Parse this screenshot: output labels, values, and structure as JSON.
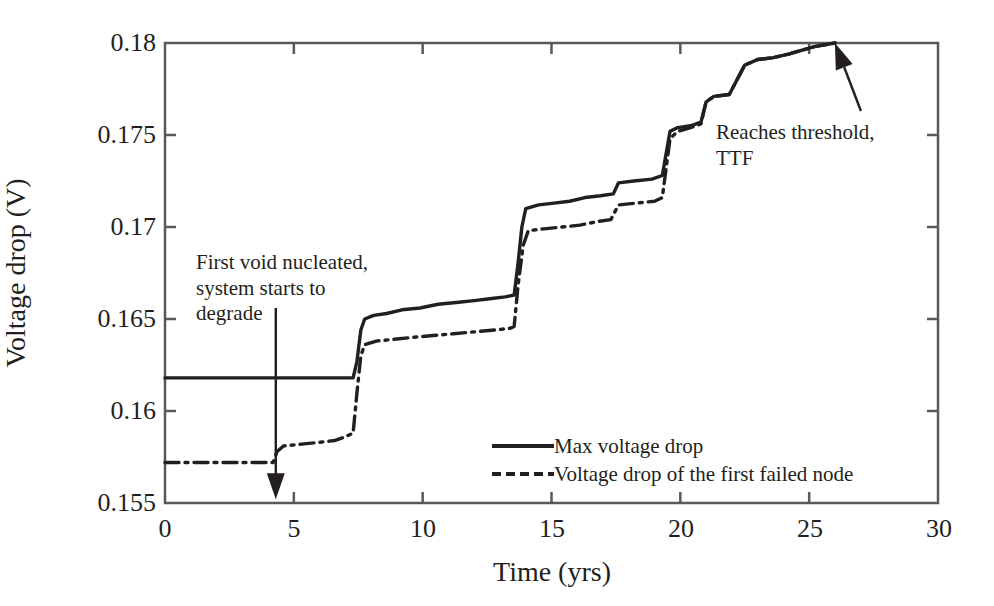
{
  "chart_data": {
    "type": "line",
    "title": "",
    "xlabel": "Time (yrs)",
    "ylabel": "Voltage drop (V)",
    "xlim": [
      0,
      30
    ],
    "ylim": [
      0.155,
      0.18
    ],
    "xticks": [
      "0",
      "5",
      "10",
      "15",
      "20",
      "25",
      "30"
    ],
    "xtick_values": [
      0,
      5,
      10,
      15,
      20,
      25,
      30
    ],
    "yticks": [
      "0.155",
      "0.16",
      "0.165",
      "0.17",
      "0.175",
      "0.18"
    ],
    "ytick_values": [
      0.155,
      0.16,
      0.165,
      0.17,
      0.175,
      0.18
    ],
    "grid": false,
    "legend_position": "center-right-inside",
    "series": [
      {
        "name": "Max voltage drop",
        "style": "solid",
        "color": "#231f20",
        "points": [
          [
            0.0,
            0.1618
          ],
          [
            4.2,
            0.1618
          ],
          [
            7.3,
            0.1618
          ],
          [
            7.45,
            0.1627
          ],
          [
            7.6,
            0.1644
          ],
          [
            7.75,
            0.165
          ],
          [
            8.1,
            0.1652
          ],
          [
            8.6,
            0.1653
          ],
          [
            9.2,
            0.1655
          ],
          [
            9.9,
            0.1656
          ],
          [
            10.6,
            0.1658
          ],
          [
            11.3,
            0.1659
          ],
          [
            12.0,
            0.166
          ],
          [
            12.6,
            0.1661
          ],
          [
            13.2,
            0.1662
          ],
          [
            13.55,
            0.1663
          ],
          [
            13.7,
            0.168
          ],
          [
            13.85,
            0.17
          ],
          [
            14.0,
            0.171
          ],
          [
            14.5,
            0.1712
          ],
          [
            15.1,
            0.1713
          ],
          [
            15.7,
            0.1714
          ],
          [
            16.3,
            0.1716
          ],
          [
            16.9,
            0.1717
          ],
          [
            17.4,
            0.1718
          ],
          [
            17.6,
            0.1724
          ],
          [
            18.2,
            0.1725
          ],
          [
            18.9,
            0.1726
          ],
          [
            19.3,
            0.1728
          ],
          [
            19.45,
            0.174
          ],
          [
            19.6,
            0.1752
          ],
          [
            19.9,
            0.1754
          ],
          [
            20.4,
            0.1755
          ],
          [
            20.8,
            0.1757
          ],
          [
            21.0,
            0.1768
          ],
          [
            21.3,
            0.1771
          ],
          [
            21.9,
            0.1772
          ],
          [
            22.2,
            0.178
          ],
          [
            22.5,
            0.1788
          ],
          [
            23.0,
            0.1791
          ],
          [
            23.6,
            0.1792
          ],
          [
            24.2,
            0.1794
          ],
          [
            24.7,
            0.1796
          ],
          [
            25.2,
            0.1798
          ],
          [
            25.6,
            0.1799
          ],
          [
            26.0,
            0.18
          ]
        ]
      },
      {
        "name": "Voltage drop of the first failed node",
        "style": "dash-dot",
        "color": "#231f20",
        "points": [
          [
            0.0,
            0.1572
          ],
          [
            4.2,
            0.1572
          ],
          [
            4.35,
            0.1578
          ],
          [
            4.6,
            0.1581
          ],
          [
            5.3,
            0.1582
          ],
          [
            6.0,
            0.1583
          ],
          [
            6.6,
            0.1584
          ],
          [
            7.0,
            0.1586
          ],
          [
            7.3,
            0.1588
          ],
          [
            7.45,
            0.161
          ],
          [
            7.6,
            0.163
          ],
          [
            7.75,
            0.1636
          ],
          [
            8.2,
            0.1638
          ],
          [
            8.9,
            0.1639
          ],
          [
            9.6,
            0.164
          ],
          [
            10.4,
            0.1641
          ],
          [
            11.2,
            0.1642
          ],
          [
            12.0,
            0.1643
          ],
          [
            12.8,
            0.1644
          ],
          [
            13.4,
            0.1645
          ],
          [
            13.55,
            0.1646
          ],
          [
            13.7,
            0.1668
          ],
          [
            13.9,
            0.169
          ],
          [
            14.1,
            0.1698
          ],
          [
            14.7,
            0.1699
          ],
          [
            15.4,
            0.17
          ],
          [
            16.1,
            0.1701
          ],
          [
            16.8,
            0.1703
          ],
          [
            17.3,
            0.1704
          ],
          [
            17.6,
            0.1712
          ],
          [
            18.3,
            0.1713
          ],
          [
            19.0,
            0.1714
          ],
          [
            19.3,
            0.1716
          ],
          [
            19.45,
            0.1732
          ],
          [
            19.6,
            0.1748
          ],
          [
            19.9,
            0.1752
          ],
          [
            20.4,
            0.1754
          ],
          [
            20.8,
            0.1756
          ],
          [
            21.0,
            0.1768
          ],
          [
            21.3,
            0.1771
          ],
          [
            21.9,
            0.1772
          ],
          [
            22.2,
            0.178
          ],
          [
            22.5,
            0.1788
          ],
          [
            23.0,
            0.1791
          ],
          [
            23.6,
            0.1792
          ],
          [
            24.2,
            0.1794
          ],
          [
            24.7,
            0.1796
          ],
          [
            25.2,
            0.1798
          ],
          [
            25.6,
            0.1799
          ],
          [
            26.0,
            0.18
          ]
        ]
      }
    ],
    "annotations": [
      {
        "id": "nucleation",
        "text": "First void nucleated,\nsystem starts to\ndegrade",
        "arrow": {
          "type": "vertical-down",
          "x_value": 4.3,
          "y_from": 0.1656,
          "y_to": 0.1552
        }
      },
      {
        "id": "threshold",
        "text": "Reaches threshold,\nTTF",
        "arrow": {
          "type": "diagonal-up-left",
          "x_tip": 26.0,
          "y_tip": 0.18
        }
      }
    ]
  },
  "legend": {
    "items": [
      {
        "label": "Max voltage drop",
        "style": "solid"
      },
      {
        "label": "Voltage drop of the first failed node",
        "style": "dash-dot"
      }
    ]
  },
  "axes": {
    "x_label": "Time (yrs)",
    "y_label": "Voltage drop (V)",
    "x_tick_labels": [
      "0",
      "5",
      "10",
      "15",
      "20",
      "25",
      "30"
    ],
    "y_tick_labels": [
      "0.155",
      "0.16",
      "0.165",
      "0.17",
      "0.175",
      "0.18"
    ]
  },
  "annotations": {
    "nucleation": "First void nucleated,\nsystem starts to\ndegrade",
    "threshold": "Reaches threshold,\nTTF"
  },
  "colors": {
    "line": "#231f20",
    "axis": "#595959",
    "background": "#ffffff"
  }
}
